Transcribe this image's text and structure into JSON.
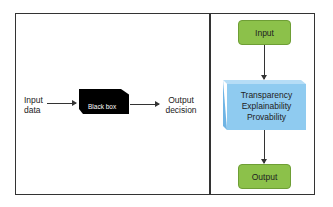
{
  "left_panel": {
    "input_label_line1": "Input",
    "input_label_line2": "data",
    "black_box_label": "Black box",
    "output_label_line1": "Output",
    "output_label_line2": "decision"
  },
  "right_panel": {
    "input_box_label": "Input",
    "process_lines": [
      "Transparency",
      "Explainability",
      "Provability"
    ],
    "output_box_label": "Output"
  },
  "colors": {
    "green_box": "#8cc14a",
    "blue_box": "#8fcbf0",
    "black_box": "#000000",
    "frame": "#333333"
  }
}
